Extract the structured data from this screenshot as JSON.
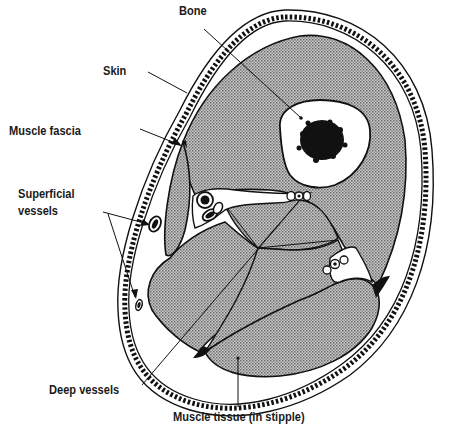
{
  "diagram": {
    "type": "anatomical cross-section (limb)",
    "colors": {
      "stroke": "#111111",
      "stipple_dark": "#6e6e6e",
      "stipple_light": "#c8c8c8",
      "background": "#ffffff",
      "bone_marrow": "#111111"
    },
    "labels": {
      "bone": "Bone",
      "skin": "Skin",
      "muscle_fascia": "Muscle fascia",
      "superficial_vessels_line1": "Superficial",
      "superficial_vessels_line2": "vessels",
      "deep_vessels": "Deep vessels",
      "muscle_tissue": "Muscle tissue (in stipple)"
    }
  }
}
